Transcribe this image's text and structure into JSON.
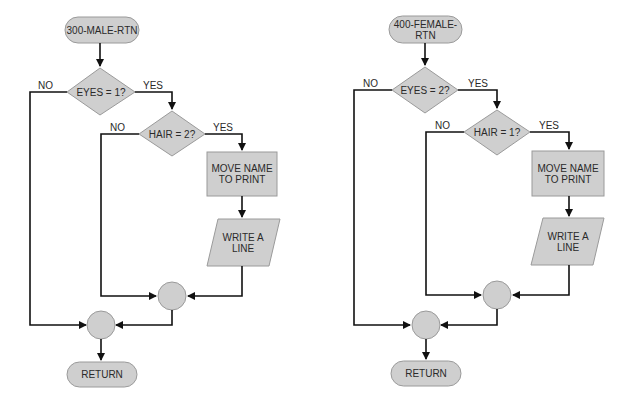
{
  "colors": {
    "shape_fill": "#cfcfcf",
    "shape_stroke": "#9a9a9a",
    "line": "#111111",
    "text": "#2a2a2a"
  },
  "flowcharts": [
    {
      "name": "male-routine",
      "start": "300-MALE-RTN",
      "decision1": {
        "label": "EYES = 1?",
        "no": "NO",
        "yes": "YES"
      },
      "decision2": {
        "label": "HAIR = 2?",
        "no": "NO",
        "yes": "YES"
      },
      "process": "MOVE NAME\nTO PRINT",
      "output": "WRITE A\nLINE",
      "end": "RETURN"
    },
    {
      "name": "female-routine",
      "start": "400-FEMALE-\nRTN",
      "decision1": {
        "label": "EYES = 2?",
        "no": "NO",
        "yes": "YES"
      },
      "decision2": {
        "label": "HAIR = 1?",
        "no": "NO",
        "yes": "YES"
      },
      "process": "MOVE NAME\nTO PRINT",
      "output": "WRITE A\nLINE",
      "end": "RETURN"
    }
  ]
}
